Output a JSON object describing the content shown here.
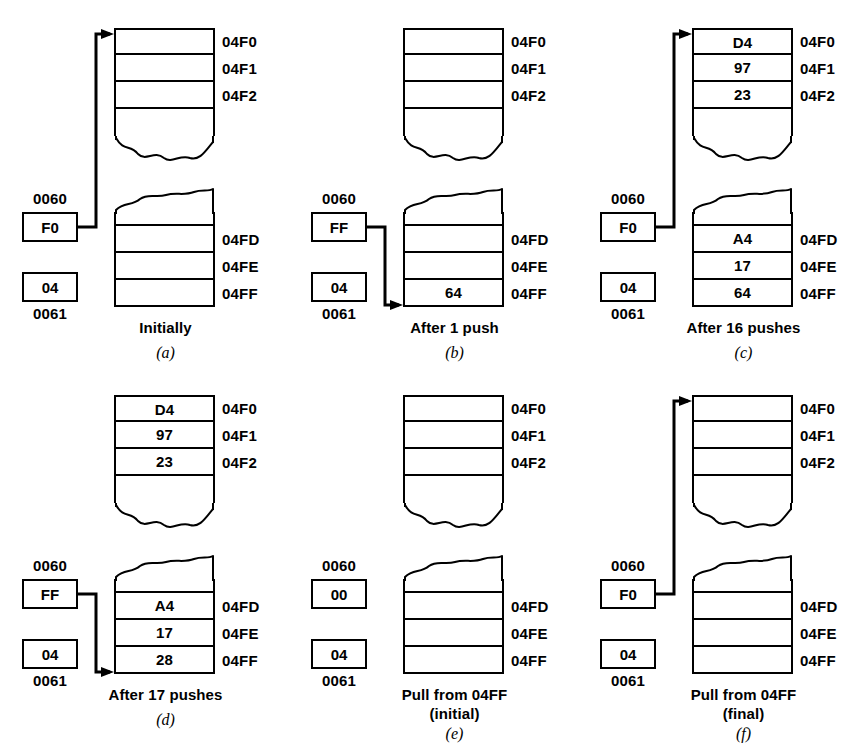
{
  "figure": {
    "panel_count": 6
  },
  "labels": {
    "addr_hi": "0060",
    "addr_lo": "0061",
    "top_addresses": [
      "04F0",
      "04F1",
      "04F2"
    ],
    "bottom_addresses": [
      "04FD",
      "04FE",
      "04FF"
    ]
  },
  "panels": [
    {
      "letter": "(a)",
      "caption": "Initially",
      "caption_line2": "",
      "sp_high": "F0",
      "sp_low": "04",
      "arrow": "up",
      "top_cells": [
        "",
        "",
        "",
        ""
      ],
      "bottom_cells": [
        "",
        "",
        "",
        ""
      ]
    },
    {
      "letter": "(b)",
      "caption": "After 1 push",
      "caption_line2": "",
      "sp_high": "FF",
      "sp_low": "04",
      "arrow": "down",
      "top_cells": [
        "",
        "",
        "",
        ""
      ],
      "bottom_cells": [
        "",
        "",
        "",
        "64"
      ]
    },
    {
      "letter": "(c)",
      "caption": "After 16 pushes",
      "caption_line2": "",
      "sp_high": "F0",
      "sp_low": "04",
      "arrow": "up",
      "top_cells": [
        "D4",
        "97",
        "23",
        ""
      ],
      "bottom_cells": [
        "",
        "A4",
        "17",
        "64"
      ]
    },
    {
      "letter": "(d)",
      "caption": "After 17 pushes",
      "caption_line2": "",
      "sp_high": "FF",
      "sp_low": "04",
      "arrow": "down",
      "top_cells": [
        "D4",
        "97",
        "23",
        ""
      ],
      "bottom_cells": [
        "",
        "A4",
        "17",
        "28"
      ]
    },
    {
      "letter": "(e)",
      "caption": "Pull from 04FF",
      "caption_line2": "(initial)",
      "sp_high": "00",
      "sp_low": "04",
      "arrow": "none",
      "top_cells": [
        "",
        "",
        "",
        ""
      ],
      "bottom_cells": [
        "",
        "",
        "",
        ""
      ]
    },
    {
      "letter": "(f)",
      "caption": "Pull from 04FF",
      "caption_line2": "(final)",
      "sp_high": "F0",
      "sp_low": "04",
      "arrow": "up",
      "top_cells": [
        "",
        "",
        "",
        ""
      ],
      "bottom_cells": [
        "",
        "",
        "",
        ""
      ]
    }
  ],
  "colors": {
    "ink": "#000000",
    "paper": "#ffffff"
  }
}
